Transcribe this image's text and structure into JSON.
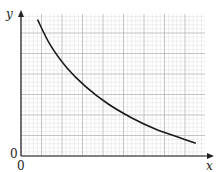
{
  "chart_data": {
    "type": "line",
    "title": "",
    "xlabel": "x",
    "ylabel": "y",
    "x_origin_label": "0",
    "y_origin_label": "0",
    "grid": true,
    "legend": null,
    "series": [
      {
        "name": "curve",
        "description": "decreasing, convex curve (inverse-like / exponential decay shape) on graph paper, no tick values shown",
        "points_normalized": [
          [
            0.09,
            0.96
          ],
          [
            0.16,
            0.78
          ],
          [
            0.25,
            0.62
          ],
          [
            0.35,
            0.49
          ],
          [
            0.47,
            0.37
          ],
          [
            0.6,
            0.27
          ],
          [
            0.73,
            0.19
          ],
          [
            0.86,
            0.13
          ],
          [
            0.95,
            0.09
          ]
        ]
      }
    ],
    "xlim": [
      0,
      1
    ],
    "ylim": [
      0,
      1
    ],
    "ticks": {
      "x": [],
      "y": []
    }
  },
  "labels": {
    "y_axis": "y",
    "x_axis": "x",
    "origin_y": "0",
    "origin_x": "0"
  },
  "colors": {
    "curve": "#1a1a1a",
    "axis": "#222222",
    "grid_major": "#b5b5b5",
    "grid_minor": "#dedede"
  }
}
